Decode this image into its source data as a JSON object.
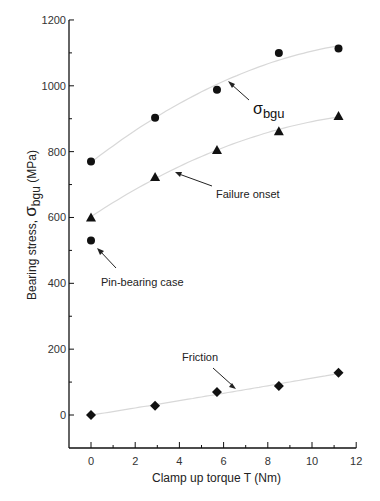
{
  "chart_data": {
    "type": "scatter",
    "title": "",
    "xlabel": "Clamp up torque  T  (Nm)",
    "ylabel": "Bearing stress,  σbgu (MPa)",
    "xlim": [
      -1,
      12
    ],
    "ylim": [
      -100,
      1200
    ],
    "x_ticks": [
      0,
      2,
      4,
      6,
      8,
      10,
      12
    ],
    "y_ticks": [
      0,
      200,
      400,
      600,
      800,
      1000,
      1200
    ],
    "grid": false,
    "series": [
      {
        "name": "σbgu",
        "marker": "circle",
        "trend": true,
        "x": [
          0,
          2.9,
          5.7,
          8.5,
          11.2
        ],
        "y": [
          770,
          903,
          988,
          1100,
          1113
        ]
      },
      {
        "name": "Failure onset",
        "marker": "triangle",
        "trend": true,
        "x": [
          0,
          2.9,
          5.7,
          8.5,
          11.2
        ],
        "y": [
          600,
          723,
          805,
          862,
          908
        ]
      },
      {
        "name": "Pin-bearing case",
        "marker": "circle",
        "trend": false,
        "x": [
          0
        ],
        "y": [
          530
        ]
      },
      {
        "name": "Friction",
        "marker": "diamond",
        "trend": true,
        "x": [
          0,
          2.9,
          5.7,
          8.5,
          11.2
        ],
        "y": [
          0,
          28,
          70,
          88,
          128
        ]
      }
    ],
    "annotations": [
      {
        "text": "σbgu",
        "main": "σ",
        "sub": "bgu"
      },
      {
        "text": "Failure onset"
      },
      {
        "text": "Pin-bearing case"
      },
      {
        "text": "Friction"
      }
    ]
  },
  "labels": {
    "xlabel": "Clamp up torque  T  (Nm)",
    "ylabel_pre": "Bearing stress,  ",
    "ylabel_sym": "σ",
    "ylabel_sub": "bgu",
    "ylabel_post": " (MPa)",
    "annot_sigma": "σ",
    "annot_sigma_sub": "bgu",
    "annot_failure": "Failure onset",
    "annot_pin": "Pin-bearing case",
    "annot_friction": "Friction"
  }
}
